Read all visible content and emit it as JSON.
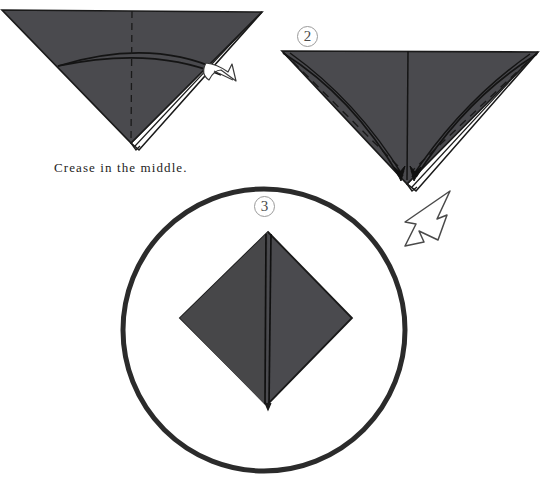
{
  "document": {
    "title": "Origami folding instructions",
    "type": "illustration",
    "background_color": "#ffffff"
  },
  "palette": {
    "paper_gray": "#4a4a4e",
    "paper_gray_dark": "#434347",
    "ink": "#1a1a1a",
    "circle_stroke": "#2b2b2b",
    "badge_stroke": "#9a9a9a",
    "white_paper": "#ffffff"
  },
  "captions": {
    "crease_instruction": "Crease in the middle."
  },
  "steps": [
    {
      "id": "step-1",
      "badge_label": "",
      "description": "Downward-pointing triangle with a vertical dashed center crease, a curved fold line across the body, and a white under-flap along the right edge with an outline arrow pointing out.",
      "caption": "Crease in the middle.",
      "shape": {
        "type": "triangle-down",
        "points": [
          [
            2,
            10
          ],
          [
            262,
            12
          ],
          [
            131,
            143
          ]
        ]
      },
      "center_crease": {
        "from": [
          132,
          11
        ],
        "to": [
          131,
          143
        ],
        "style": "dashed"
      },
      "arrow": {
        "style": "outline",
        "direction": "down-right",
        "from": [
          210,
          68
        ],
        "to": [
          237,
          80
        ]
      }
    },
    {
      "id": "step-2",
      "badge_label": "2",
      "description": "Downward-pointing triangle with dashed diagonal lines from the two top corners to the center, curved solid fold lines sweeping down to the bottom apex, and small solid arrowheads at the apex.",
      "shape": {
        "type": "triangle-down",
        "points": [
          [
            282,
            51
          ],
          [
            538,
            52
          ],
          [
            407,
            184
          ]
        ]
      },
      "center_crease": {
        "from": [
          408,
          51
        ],
        "to": [
          407,
          184
        ],
        "style": "solid"
      },
      "dashed_lines": [
        {
          "from": [
            282,
            51
          ],
          "to": [
            407,
            170
          ]
        },
        {
          "from": [
            538,
            52
          ],
          "to": [
            407,
            170
          ]
        }
      ],
      "arrowheads": [
        {
          "at": [
            399,
            178
          ],
          "direction": "down"
        },
        {
          "at": [
            415,
            178
          ],
          "direction": "down"
        }
      ]
    },
    {
      "id": "step-3",
      "badge_label": "3",
      "description": "A kite-shaped diamond of folded gray paper with a vertical center seam, enclosed in a thick hand-drawn circle.",
      "circle": {
        "cx": 264,
        "cy": 330,
        "r": 142,
        "stroke_width": 5
      },
      "shape": {
        "type": "diamond",
        "points": [
          [
            268,
            232
          ],
          [
            352,
            318
          ],
          [
            267,
            405
          ],
          [
            180,
            318
          ]
        ]
      },
      "center_seam": {
        "from": [
          268,
          232
        ],
        "to": [
          267,
          405
        ],
        "style": "solid"
      }
    }
  ],
  "transition_arrows": [
    {
      "id": "arrow-step2-to-step3",
      "style": "outline-broad",
      "direction": "down-left",
      "from": [
        447,
        192
      ],
      "to": [
        408,
        247
      ]
    }
  ]
}
